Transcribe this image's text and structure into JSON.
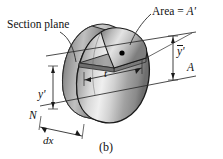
{
  "figure": {
    "caption": "(b)",
    "background_color": "#ffffff",
    "ink_color": "#111111"
  },
  "labels": {
    "section_plane": "Section plane",
    "area": "Area = A'",
    "area_text": "Area =",
    "area_symbol": "A'",
    "y_bar_prime": "y'",
    "y_bar_prime_full": "ȳ'",
    "axis_A": "A",
    "axis_N": "N",
    "y_prime": "y'",
    "thickness": "t",
    "element_width": "dx"
  },
  "geometry": {
    "solid_description": "egg-shaped prismatic solid with section plane",
    "front_face_fill": "#b9b9b9",
    "back_face_fill": "#8e8e8e",
    "top_cut_fill": "#9a9a9a",
    "outline_color": "#1a1a1a",
    "centroid_dot_color": "#000000"
  },
  "dimension_lines": {
    "y_bar_prime_extent": "from neutral axis A to centroid level",
    "y_prime_extent": "from N reference to section plane level",
    "t_extent": "width of cut section",
    "dx_extent": "depth of differential element"
  }
}
